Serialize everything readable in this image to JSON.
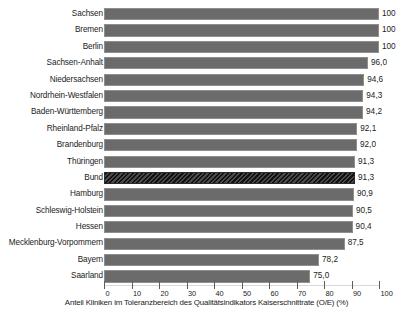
{
  "chart_data": {
    "type": "bar",
    "orientation": "horizontal",
    "title": "",
    "xlabel": "Anteil Kliniken im Toleranzbereich des Qualitätsindikators Kaiserschnittrate (O/E) (%)",
    "ylabel": "",
    "xlim": [
      0,
      100
    ],
    "xticks": [
      0,
      10,
      20,
      30,
      40,
      50,
      60,
      70,
      80,
      90,
      100
    ],
    "xtick_labels": [
      "0",
      "10",
      "20",
      "30",
      "40",
      "50",
      "60",
      "70",
      "80",
      "90",
      "100"
    ],
    "grid": false,
    "legend": "none",
    "bar_color": "#6b6b6b",
    "highlight_color": "#1e1e1e",
    "categories": [
      "Sachsen",
      "Bremen",
      "Berlin",
      "Sachsen-Anhalt",
      "Niedersachsen",
      "Nordrhein-Westfalen",
      "Baden-Württemberg",
      "Rheinland-Pfalz",
      "Brandenburg",
      "Thüringen",
      "Bund",
      "Hamburg",
      "Schleswig-Holstein",
      "Hessen",
      "Mecklenburg-Vorpommern",
      "Bayern",
      "Saarland"
    ],
    "values": [
      100,
      100,
      100,
      96.0,
      94.6,
      94.3,
      94.2,
      92.1,
      92.0,
      91.3,
      91.3,
      90.9,
      90.5,
      90.4,
      87.5,
      78.2,
      75.0
    ],
    "value_labels": [
      "100",
      "100",
      "100",
      "96,0",
      "94,6",
      "94,3",
      "94,2",
      "92,1",
      "92,0",
      "91,3",
      "91,3",
      "90,9",
      "90,5",
      "90,4",
      "87,5",
      "78,2",
      "75,0"
    ],
    "highlighted": [
      "Bund"
    ],
    "bars": [
      {
        "label": "Sachsen",
        "value": 100,
        "value_label": "100",
        "highlight": false
      },
      {
        "label": "Bremen",
        "value": 100,
        "value_label": "100",
        "highlight": false
      },
      {
        "label": "Berlin",
        "value": 100,
        "value_label": "100",
        "highlight": false
      },
      {
        "label": "Sachsen-Anhalt",
        "value": 96.0,
        "value_label": "96,0",
        "highlight": false
      },
      {
        "label": "Niedersachsen",
        "value": 94.6,
        "value_label": "94,6",
        "highlight": false
      },
      {
        "label": "Nordrhein-Westfalen",
        "value": 94.3,
        "value_label": "94,3",
        "highlight": false
      },
      {
        "label": "Baden-Württemberg",
        "value": 94.2,
        "value_label": "94,2",
        "highlight": false
      },
      {
        "label": "Rheinland-Pfalz",
        "value": 92.1,
        "value_label": "92,1",
        "highlight": false
      },
      {
        "label": "Brandenburg",
        "value": 92.0,
        "value_label": "92,0",
        "highlight": false
      },
      {
        "label": "Thüringen",
        "value": 91.3,
        "value_label": "91,3",
        "highlight": false
      },
      {
        "label": "Bund",
        "value": 91.3,
        "value_label": "91,3",
        "highlight": true
      },
      {
        "label": "Hamburg",
        "value": 90.9,
        "value_label": "90,9",
        "highlight": false
      },
      {
        "label": "Schleswig-Holstein",
        "value": 90.5,
        "value_label": "90,5",
        "highlight": false
      },
      {
        "label": "Hessen",
        "value": 90.4,
        "value_label": "90,4",
        "highlight": false
      },
      {
        "label": "Mecklenburg-Vorpommern",
        "value": 87.5,
        "value_label": "87,5",
        "highlight": false
      },
      {
        "label": "Bayern",
        "value": 78.2,
        "value_label": "78,2",
        "highlight": false
      },
      {
        "label": "Saarland",
        "value": 75.0,
        "value_label": "75,0",
        "highlight": false
      }
    ]
  }
}
